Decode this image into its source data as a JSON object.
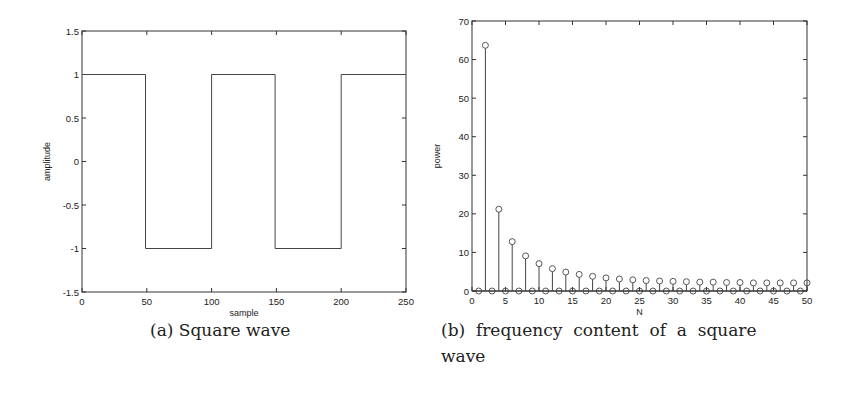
{
  "chart_data": [
    {
      "type": "line",
      "title": "",
      "caption": "(a) Square wave",
      "xlabel": "sample",
      "ylabel": "amplitude",
      "xlim": [
        0,
        250
      ],
      "ylim": [
        -1.5,
        1.5
      ],
      "xticks": [
        0,
        50,
        100,
        150,
        200,
        250
      ],
      "yticks": [
        -1.5,
        -1,
        -0.5,
        0,
        0.5,
        1,
        1.5
      ],
      "grid": false,
      "series": [
        {
          "name": "square wave",
          "x": [
            0,
            49,
            49,
            100,
            100,
            149,
            149,
            200,
            200,
            250
          ],
          "y": [
            1,
            1,
            -1,
            -1,
            1,
            1,
            -1,
            -1,
            1,
            1
          ]
        }
      ]
    },
    {
      "type": "stem",
      "title": "",
      "caption": "(b) frequency content of a square wave",
      "xlabel": "N",
      "ylabel": "power",
      "xlim": [
        0,
        50
      ],
      "ylim": [
        0,
        70
      ],
      "xticks": [
        0,
        5,
        10,
        15,
        20,
        25,
        30,
        35,
        40,
        45,
        50
      ],
      "yticks": [
        0,
        10,
        20,
        30,
        40,
        50,
        60,
        70
      ],
      "grid": false,
      "series": [
        {
          "name": "power",
          "x": [
            1,
            2,
            3,
            4,
            5,
            6,
            7,
            8,
            9,
            10,
            11,
            12,
            13,
            14,
            15,
            16,
            17,
            18,
            19,
            20,
            21,
            22,
            23,
            24,
            25,
            26,
            27,
            28,
            29,
            30,
            31,
            32,
            33,
            34,
            35,
            36,
            37,
            38,
            39,
            40,
            41,
            42,
            43,
            44,
            45,
            46,
            47,
            48,
            49,
            50
          ],
          "y": [
            0,
            63.7,
            0,
            21.2,
            0,
            12.8,
            0,
            9.1,
            0,
            7.1,
            0,
            5.8,
            0,
            4.9,
            0,
            4.3,
            0,
            3.8,
            0,
            3.4,
            0,
            3.1,
            0,
            2.9,
            0,
            2.7,
            0,
            2.6,
            0,
            2.5,
            0,
            2.4,
            0,
            2.3,
            0,
            2.3,
            0,
            2.2,
            0,
            2.2,
            0,
            2.1,
            0,
            2.1,
            0,
            2.1,
            0,
            2.1,
            0,
            2.1
          ]
        }
      ]
    }
  ],
  "captions": {
    "a": "(a) Square wave",
    "b_line1": "(b)  frequency  content  of  a  square",
    "b_line2": "wave"
  }
}
